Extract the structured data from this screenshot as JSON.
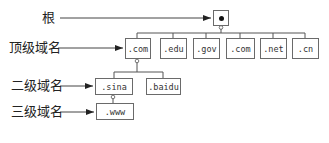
{
  "diagram": {
    "type": "tree",
    "labels": {
      "root": "根",
      "top_level": "顶级域名",
      "second_level": "二级域名",
      "third_level": "三级域名"
    },
    "root_node": {
      "symbol": "•"
    },
    "top_level_nodes": [
      ".com",
      ".edu",
      ".gov",
      ".com",
      ".net",
      ".cn"
    ],
    "second_level_nodes": [
      ".sina",
      ".baidu"
    ],
    "third_level_nodes": [
      ".www"
    ],
    "edges": [
      [
        "root",
        ".com"
      ],
      [
        "root",
        ".edu"
      ],
      [
        "root",
        ".gov"
      ],
      [
        "root",
        ".com"
      ],
      [
        "root",
        ".net"
      ],
      [
        "root",
        ".cn"
      ],
      [
        ".com",
        ".sina"
      ],
      [
        ".com",
        ".baidu"
      ],
      [
        ".sina",
        ".www"
      ]
    ],
    "colors": {
      "line": "#555555",
      "border": "#6a6a6a",
      "text": "#222222"
    }
  }
}
